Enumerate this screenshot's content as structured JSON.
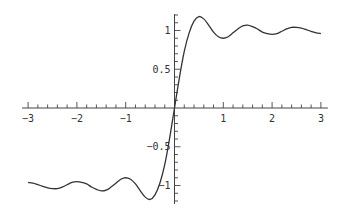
{
  "chart_data": {
    "type": "line",
    "title": "",
    "xlabel": "",
    "ylabel": "",
    "xlim": [
      -3,
      3
    ],
    "ylim": [
      -1.22,
      1.22
    ],
    "grid": false,
    "legend": null,
    "axes_style": "through-origin",
    "x_ticks_major": [
      -3,
      -2,
      -1,
      1,
      2,
      3
    ],
    "x_tick_labels": [
      "-3",
      "-2",
      "-1",
      "1",
      "2",
      "3"
    ],
    "x_minor_step": 0.2,
    "y_ticks_major": [
      -1,
      -0.5,
      0.5,
      1
    ],
    "y_tick_labels": [
      "-1",
      "-0.5",
      "0.5",
      "1"
    ],
    "y_minor_step": 0.1,
    "series": [
      {
        "name": "f(x)",
        "color": "#333333",
        "odd_symmetric": true,
        "x": [
          0,
          0.1,
          0.2,
          0.3,
          0.4,
          0.5,
          0.6,
          0.7,
          0.8,
          0.9,
          1.0,
          1.1,
          1.2,
          1.3,
          1.4,
          1.5,
          1.6,
          1.7,
          1.8,
          1.9,
          2.0,
          2.1,
          2.2,
          2.3,
          2.4,
          2.5,
          2.6,
          2.7,
          2.8,
          2.9,
          3.0
        ],
        "y": [
          0,
          0.39,
          0.73,
          0.97,
          1.12,
          1.18,
          1.15,
          1.07,
          0.98,
          0.92,
          0.9,
          0.92,
          0.97,
          1.02,
          1.06,
          1.07,
          1.05,
          1.02,
          0.98,
          0.96,
          0.95,
          0.96,
          0.99,
          1.02,
          1.04,
          1.04,
          1.03,
          1.01,
          0.99,
          0.97,
          0.96
        ]
      }
    ]
  }
}
